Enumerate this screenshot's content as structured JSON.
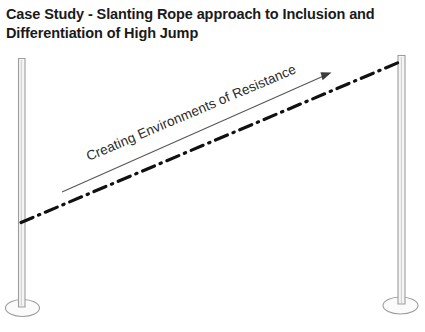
{
  "title": {
    "line1": "Case Study - Slanting Rope approach to Inclusion and",
    "line2": "Differentiation of High Jump"
  },
  "diagram": {
    "type": "slanting-rope-high-jump",
    "rope_label": "Creating Environments of Resistance",
    "left_post": {
      "name": "left-upright-post",
      "top_y": 58,
      "bottom_y": 306,
      "x": 18,
      "width": 7,
      "base_label": "left-post-base"
    },
    "right_post": {
      "name": "right-upright-post",
      "top_y": 55,
      "bottom_y": 303,
      "x": 398,
      "width": 7,
      "base_label": "right-post-base"
    },
    "rope": {
      "name": "slanting-rope",
      "start": [
        22,
        222
      ],
      "end": [
        401,
        62
      ],
      "style": "dash-dot",
      "color": "#111111"
    },
    "direction_arrow": {
      "name": "resistance-direction-arrow",
      "start": [
        62,
        192
      ],
      "end": [
        331,
        73
      ],
      "color": "#555555"
    },
    "colors": {
      "post_outline": "#9a9a9a",
      "post_fill": "#f4f4f4",
      "rope": "#111111",
      "arrow": "#555555",
      "text": "#1a1a1a",
      "background": "#ffffff"
    }
  }
}
